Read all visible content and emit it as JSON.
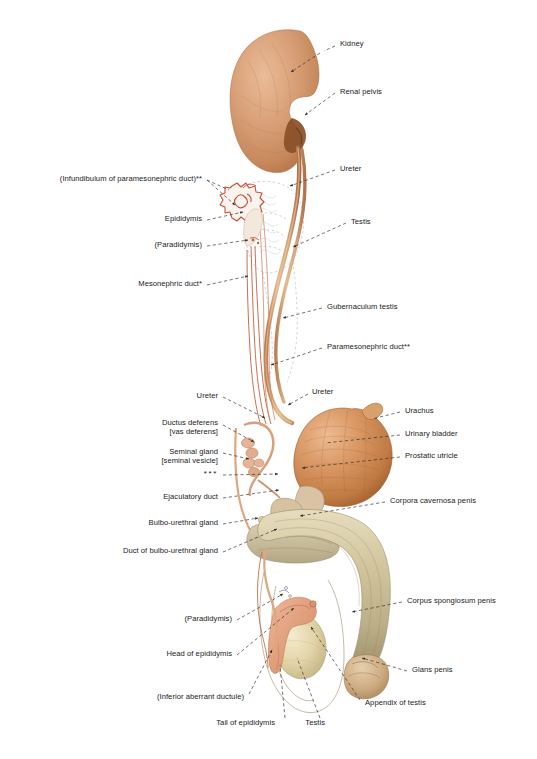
{
  "figure": {
    "width": 537,
    "height": 759,
    "background": "#ffffff"
  },
  "palette": {
    "kidney_light": "#e0ab84",
    "kidney_mid": "#cd8e62",
    "kidney_dark": "#b1713f",
    "bladder_light": "#e3a87c",
    "bladder_mid": "#c87f4c",
    "bladder_dark": "#9b5a2c",
    "penis_light": "#ded3b4",
    "penis_mid": "#c9bb94",
    "penis_dark": "#a89a73",
    "testis_light": "#efe6c4",
    "testis_mid": "#ded0a2",
    "epididymis": "#e0a385",
    "duct_tan": "#d9a87a",
    "duct_red": "#c0563d",
    "ghost_outline": "#c9c6d6",
    "leader": "#2a2a2a",
    "text": "#1a1a1a"
  },
  "labels": {
    "right": [
      {
        "id": "kidney",
        "text": "Kidney",
        "x": 340,
        "y": 44
      },
      {
        "id": "renal-pelvis",
        "text": "Renal pelvis",
        "x": 340,
        "y": 92
      },
      {
        "id": "ureter-upper",
        "text": "Ureter",
        "x": 340,
        "y": 169
      },
      {
        "id": "testis-ghost",
        "text": "Testis",
        "x": 351,
        "y": 222
      },
      {
        "id": "gubernaculum-testis",
        "text": "Gubernaculum testis",
        "x": 327,
        "y": 307
      },
      {
        "id": "paramesonephric-duct",
        "text": "Paramesonephric duct**",
        "x": 327,
        "y": 347
      },
      {
        "id": "ureter-bladder",
        "text": "Ureter",
        "x": 312,
        "y": 392
      },
      {
        "id": "urachus",
        "text": "Urachus",
        "x": 405,
        "y": 411
      },
      {
        "id": "urinary-bladder",
        "text": "Urinary bladder",
        "x": 405,
        "y": 434
      },
      {
        "id": "prostatic-utricle",
        "text": "Prostatic utricle",
        "x": 405,
        "y": 456
      },
      {
        "id": "corpora-cavernosa-penis",
        "text": "Corpora cavernosa penis",
        "x": 390,
        "y": 501
      },
      {
        "id": "corpus-spongiosum-penis",
        "text": "Corpus spongiosum penis",
        "x": 407,
        "y": 601
      },
      {
        "id": "glans-penis",
        "text": "Glans penis",
        "x": 412,
        "y": 670
      },
      {
        "id": "appendix-of-testis",
        "text": "Appendix of testis",
        "x": 365,
        "y": 703
      }
    ],
    "left": [
      {
        "id": "infundibulum-paramesonephric-duct",
        "text": "(Infundibulum of paramesonephric duct)**",
        "x": 202,
        "y": 179
      },
      {
        "id": "epididymis-upper",
        "text": "Epididymis",
        "x": 202,
        "y": 219
      },
      {
        "id": "paradidymis-upper",
        "text": "(Paradidymis)",
        "x": 202,
        "y": 245
      },
      {
        "id": "mesonephric-duct",
        "text": "Mesonephric duct*",
        "x": 202,
        "y": 284
      },
      {
        "id": "ureter-left",
        "text": "Ureter",
        "x": 218,
        "y": 396
      },
      {
        "id": "ductus-deferens",
        "text": "Ductus deferens\n[vas deferens]",
        "x": 218,
        "y": 423
      },
      {
        "id": "seminal-gland",
        "text": "Seminal gland\n[seminal vesicle]",
        "x": 218,
        "y": 452
      },
      {
        "id": "triple-asterisk",
        "text": "***",
        "x": 218,
        "y": 474
      },
      {
        "id": "ejaculatory-duct",
        "text": "Ejaculatory duct",
        "x": 218,
        "y": 497
      },
      {
        "id": "bulbo-urethral-gland",
        "text": "Bulbo-urethral gland",
        "x": 218,
        "y": 523
      },
      {
        "id": "duct-of-bulbo-urethral-gland",
        "text": "Duct of bulbo-urethral gland",
        "x": 218,
        "y": 551
      },
      {
        "id": "paradidymis-lower",
        "text": "(Paradidymis)",
        "x": 232,
        "y": 619
      },
      {
        "id": "head-of-epididymis",
        "text": "Head of epididymis",
        "x": 232,
        "y": 654
      },
      {
        "id": "inferior-aberrant-ductule",
        "text": "(Inferior aberrant ductule)",
        "x": 244,
        "y": 697
      },
      {
        "id": "tail-of-epididymis",
        "text": "Tail of epididymis",
        "x": 275,
        "y": 723
      },
      {
        "id": "testis-lower",
        "text": "Testis",
        "x": 325,
        "y": 723
      }
    ]
  },
  "leaders": [
    {
      "id": "leader-kidney",
      "d": "M 335 46 L 324 51 M 320 53 L 291 72",
      "arrow": true,
      "dashed": true
    },
    {
      "id": "leader-renal-pelvis",
      "d": "M 335 93 L 305 115",
      "arrow": true,
      "dashed": true
    },
    {
      "id": "leader-ureter-upper",
      "d": "M 335 170 L 290 186",
      "arrow": true,
      "dashed": true
    },
    {
      "id": "leader-testis-ghost",
      "d": "M 346 223 L 293 247",
      "arrow": true,
      "dashed": true
    },
    {
      "id": "leader-gubernaculum",
      "d": "M 322 308 L 283 318",
      "arrow": true,
      "dashed": true
    },
    {
      "id": "leader-paramesoneph",
      "d": "M 322 348 L 271 365",
      "arrow": true,
      "dashed": true
    },
    {
      "id": "leader-ureter-bladder",
      "d": "M 308 394 L 288 405",
      "arrow": true,
      "dashed": true
    },
    {
      "id": "leader-urachus",
      "d": "M 400 412 L 372 419",
      "arrow": false,
      "dashed": true
    },
    {
      "id": "leader-bladder",
      "d": "M 400 435 L 325 443",
      "arrow": false,
      "dashed": true
    },
    {
      "id": "leader-prostatic",
      "d": "M 400 457 L 302 468",
      "arrow": true,
      "dashed": true
    },
    {
      "id": "leader-corp-cav",
      "d": "M 385 502 L 300 516",
      "arrow": true,
      "dashed": true
    },
    {
      "id": "leader-corp-spong",
      "d": "M 402 602 L 352 612",
      "arrow": true,
      "dashed": true
    },
    {
      "id": "leader-glans",
      "d": "M 407 671 L 362 658",
      "arrow": true,
      "dashed": true
    },
    {
      "id": "leader-appendix",
      "d": "M 360 700 L 311 627",
      "arrow": true,
      "dashed": true
    },
    {
      "id": "leader-infundibulum",
      "d": "M 207 180 L 229 190 M 207 180 L 235 205",
      "arrow": true,
      "dashed": true
    },
    {
      "id": "leader-epididymis-up",
      "d": "M 207 220 L 243 212",
      "arrow": true,
      "dashed": true
    },
    {
      "id": "leader-paradidymis-up",
      "d": "M 207 246 L 248 240",
      "arrow": true,
      "dashed": true
    },
    {
      "id": "leader-mesoneph",
      "d": "M 207 285 L 248 276",
      "arrow": true,
      "dashed": true
    },
    {
      "id": "leader-ureter-left",
      "d": "M 223 397 L 265 418",
      "arrow": true,
      "dashed": true
    },
    {
      "id": "leader-ductus-def",
      "d": "M 223 425 L 254 442",
      "arrow": true,
      "dashed": true
    },
    {
      "id": "leader-seminal",
      "d": "M 223 453 L 249 459",
      "arrow": true,
      "dashed": true
    },
    {
      "id": "leader-stars",
      "d": "M 223 475 L 278 474",
      "arrow": true,
      "dashed": true
    },
    {
      "id": "leader-ejac-duct",
      "d": "M 223 498 L 279 490",
      "arrow": true,
      "dashed": true
    },
    {
      "id": "leader-bulbo-gl",
      "d": "M 223 524 L 258 518",
      "arrow": true,
      "dashed": true
    },
    {
      "id": "leader-bulbo-duct",
      "d": "M 223 552 L 277 529",
      "arrow": true,
      "dashed": true
    },
    {
      "id": "leader-paradidymis-lo",
      "d": "M 237 620 L 283 594",
      "arrow": true,
      "dashed": true
    },
    {
      "id": "leader-head-epid",
      "d": "M 237 655 L 294 608",
      "arrow": true,
      "dashed": true
    },
    {
      "id": "leader-inf-aberrant",
      "d": "M 249 694 L 272 650",
      "arrow": true,
      "dashed": true
    },
    {
      "id": "leader-tail-epid",
      "d": "M 285 718 L 280 665",
      "arrow": false,
      "dashed": true
    },
    {
      "id": "leader-testis-lower",
      "d": "M 320 718 L 297 658",
      "arrow": false,
      "dashed": true
    }
  ],
  "footnotes": {
    "single_asterisk": "*",
    "double_asterisk": "**",
    "triple_asterisk": "***"
  }
}
